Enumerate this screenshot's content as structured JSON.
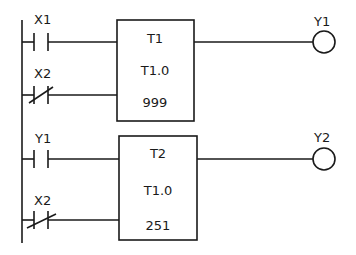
{
  "diagram": {
    "type": "ladder-logic",
    "rungs": [
      {
        "contacts": [
          {
            "label": "X1",
            "kind": "normally-open"
          },
          {
            "label": "X2",
            "kind": "normally-closed"
          }
        ],
        "block": {
          "name": "T1",
          "base": "T1.0",
          "preset": "999"
        },
        "coil": {
          "label": "Y1"
        }
      },
      {
        "contacts": [
          {
            "label": "Y1",
            "kind": "normally-open"
          },
          {
            "label": "X2",
            "kind": "normally-closed"
          }
        ],
        "block": {
          "name": "T2",
          "base": "T1.0",
          "preset": "251"
        },
        "coil": {
          "label": "Y2"
        }
      }
    ]
  }
}
